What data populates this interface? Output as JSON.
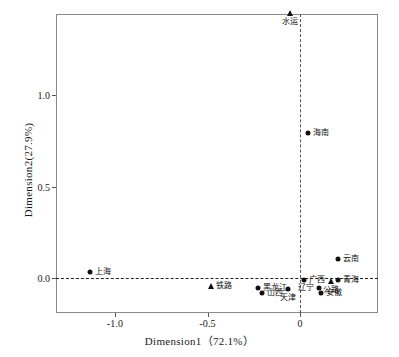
{
  "chart_data": {
    "type": "scatter",
    "title": "",
    "xlabel": "Dimension1（72.1%）",
    "ylabel": "Dimension2(27.9%)",
    "xlim": [
      -1.32,
      0.42
    ],
    "ylim": [
      -0.115,
      1.5
    ],
    "xticks": [
      "-1.0",
      "-0.5",
      "0"
    ],
    "xtick_values": [
      -1.0,
      -0.5,
      0
    ],
    "yticks": [
      "0.0",
      "0.5",
      "1.0"
    ],
    "ytick_values": [
      0.0,
      0.5,
      1.0
    ],
    "grid": false,
    "legend": "none",
    "reference_lines": {
      "x": 0,
      "y": 0,
      "style": "dashed"
    },
    "series": [
      {
        "name": "省份",
        "marker": "circle",
        "points": [
          {
            "label": "上海",
            "x": -1.135,
            "y": 0.035,
            "label_pos": "right"
          },
          {
            "label": "黑龙江",
            "x": -0.225,
            "y": -0.055,
            "label_pos": "right"
          },
          {
            "label": "山西",
            "x": -0.205,
            "y": -0.08,
            "label_pos": "right"
          },
          {
            "label": "天津",
            "x": -0.065,
            "y": -0.062,
            "label_pos": "below"
          },
          {
            "label": "广西",
            "x": 0.022,
            "y": -0.012,
            "label_pos": "right"
          },
          {
            "label": "辽宁",
            "x": 0.1,
            "y": -0.055,
            "label_pos": "left"
          },
          {
            "label": "安徽",
            "x": 0.115,
            "y": -0.082,
            "label_pos": "right"
          },
          {
            "label": "青海",
            "x": 0.205,
            "y": -0.012,
            "label_pos": "right"
          },
          {
            "label": "云南",
            "x": 0.205,
            "y": 0.102,
            "label_pos": "right"
          },
          {
            "label": "海南",
            "x": 0.042,
            "y": 0.795,
            "label_pos": "right"
          }
        ]
      },
      {
        "name": "运输方式",
        "marker": "triangle",
        "points": [
          {
            "label": "水运",
            "x": -0.055,
            "y": 1.447,
            "label_pos": "below"
          },
          {
            "label": "铁路",
            "x": -0.482,
            "y": -0.042,
            "label_pos": "right"
          },
          {
            "label": "公路",
            "x": 0.165,
            "y": -0.018,
            "label_pos": "below"
          }
        ]
      }
    ]
  }
}
